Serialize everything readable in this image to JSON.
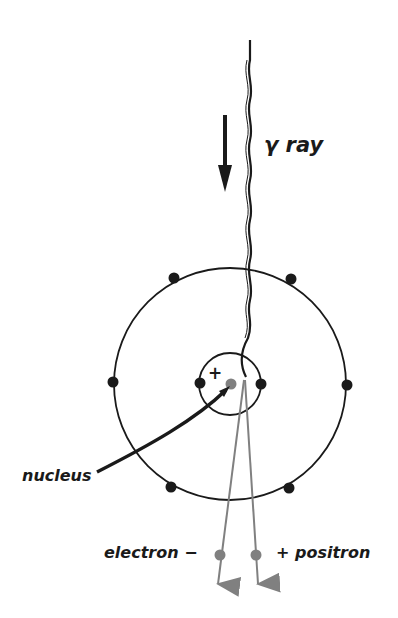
{
  "diagram": {
    "labels": {
      "gamma_ray": "γ ray",
      "nucleus": "nucleus",
      "electron": "electron −",
      "positron": "+ positron",
      "nucleus_charge": "+"
    },
    "colors": {
      "ink": "#1a1a1a",
      "particle_gray": "#808080",
      "background": "#ffffff"
    },
    "atom": {
      "center": [
        230,
        384
      ],
      "outer_radius": 116,
      "inner_radius": 30,
      "outer_electrons": 8,
      "inner_electrons": 2
    }
  }
}
